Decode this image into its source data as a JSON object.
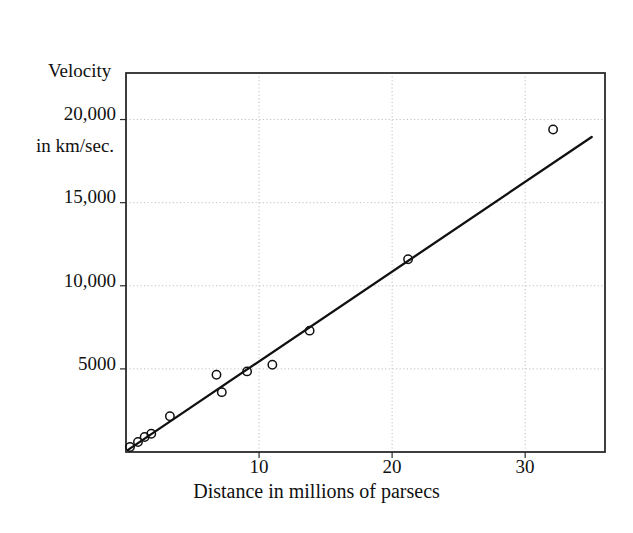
{
  "chart_data": {
    "type": "scatter",
    "title": "",
    "xlabel": "Distance in millions of parsecs",
    "ylabel_line1": "Velocity",
    "ylabel_line2": "in km/sec.",
    "xlim": [
      0,
      36
    ],
    "ylim": [
      0,
      22800
    ],
    "xticks": [
      10,
      20,
      30
    ],
    "xtick_labels": [
      "10",
      "20",
      "30"
    ],
    "yticks": [
      5000,
      10000,
      15000,
      20000
    ],
    "ytick_labels": [
      "5000",
      "10,000",
      "15,000",
      "20,000"
    ],
    "grid": "dotted-light",
    "legend": "none",
    "marker": "open-circle",
    "marker_color": "#111111",
    "line_color": "#111111",
    "points": [
      {
        "x": 0.3,
        "y": 300
      },
      {
        "x": 0.9,
        "y": 600
      },
      {
        "x": 1.4,
        "y": 900
      },
      {
        "x": 1.9,
        "y": 1100
      },
      {
        "x": 3.3,
        "y": 2150
      },
      {
        "x": 6.8,
        "y": 4650
      },
      {
        "x": 7.2,
        "y": 3600
      },
      {
        "x": 9.1,
        "y": 4850
      },
      {
        "x": 11.0,
        "y": 5250
      },
      {
        "x": 13.8,
        "y": 7300
      },
      {
        "x": 21.2,
        "y": 11600
      },
      {
        "x": 32.1,
        "y": 19400
      }
    ],
    "fit_line": {
      "x_start": 0.15,
      "y_start": 130,
      "x_end": 35.0,
      "y_end": 18950,
      "slope_per_mpc": 540,
      "description": "linear regression through origin (Hubble relation)"
    }
  }
}
